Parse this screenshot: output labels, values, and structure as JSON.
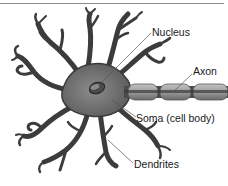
{
  "diagram": {
    "labels": {
      "nucleus": "Nucleus",
      "axon": "Axon",
      "soma": "Soma (cell body)",
      "dendrites": "Dendrites"
    },
    "colors": {
      "cell_fill": "#6e6e6e",
      "cell_dark": "#3a3a3a",
      "myelin_fill": "#a8a8a8",
      "leader_line": "#555555",
      "top_rule": "#8a8a8a"
    }
  }
}
